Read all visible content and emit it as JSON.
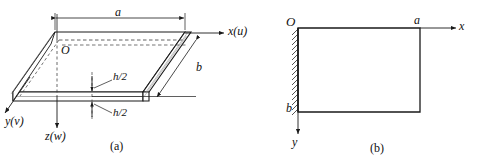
{
  "figure": {
    "background_color": "#ffffff",
    "line_color": "#1a1a1a",
    "panels": [
      {
        "id": "a",
        "caption": "(a)",
        "description": "Three-dimensional view of a rectangular plate of side lengths a and b and thickness h, with the origin O at the mid-plane corner.",
        "axes": [
          {
            "name": "x-axis",
            "label": "x(u)",
            "direction": "right"
          },
          {
            "name": "y-axis",
            "label": "y(v)",
            "direction": "down-left"
          },
          {
            "name": "z-axis",
            "label": "z(w)",
            "direction": "down"
          }
        ],
        "origin_label": "O",
        "dimensions": [
          {
            "name": "length-a",
            "label": "a",
            "orientation": "horizontal-top"
          },
          {
            "name": "width-b",
            "label": "b",
            "orientation": "oblique-right"
          },
          {
            "name": "half-thickness-upper",
            "label": "h/2",
            "orientation": "vertical"
          },
          {
            "name": "half-thickness-lower",
            "label": "h/2",
            "orientation": "vertical"
          }
        ]
      },
      {
        "id": "b",
        "caption": "(b)",
        "description": "Plan view of the plate showing the clamped left edge with hatching.",
        "axes": [
          {
            "name": "x-axis",
            "label": "x",
            "direction": "right"
          },
          {
            "name": "y-axis",
            "label": "y",
            "direction": "down"
          }
        ],
        "origin_label": "O",
        "corner_labels": [
          {
            "name": "length-a",
            "label": "a"
          },
          {
            "name": "width-b",
            "label": "b"
          }
        ],
        "edge_condition": "hatched-clamped-left-edge"
      }
    ]
  }
}
